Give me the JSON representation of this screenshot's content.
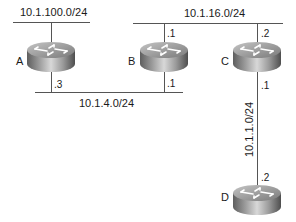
{
  "diagram": {
    "type": "network-topology",
    "networks": {
      "net_a": {
        "label": "10.1.100.0/24"
      },
      "net_bc": {
        "label": "10.1.16.0/24"
      },
      "net_ab": {
        "label": "10.1.4.0/24"
      },
      "net_cd": {
        "label": "10.1.1.0/24"
      }
    },
    "routers": {
      "a": {
        "name": "A",
        "ifaces": {
          "net_ab": ".3"
        }
      },
      "b": {
        "name": "B",
        "ifaces": {
          "net_bc": ".1",
          "net_ab": ".1"
        }
      },
      "c": {
        "name": "C",
        "ifaces": {
          "net_bc": ".2",
          "net_cd": ".1"
        }
      },
      "d": {
        "name": "D",
        "ifaces": {
          "net_cd": ".2"
        }
      }
    },
    "colors": {
      "line": "#555555",
      "router_body": "#8a8a8a",
      "router_top": "#b8b8b8",
      "arrow": "#ffffff"
    }
  }
}
